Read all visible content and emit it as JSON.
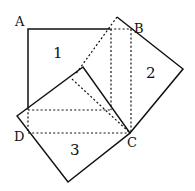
{
  "diagram": {
    "points": {
      "A": {
        "label": "A",
        "x": 28,
        "y": 29
      },
      "B": {
        "label": "B",
        "x": 131,
        "y": 29
      },
      "C": {
        "label": "C",
        "x": 130,
        "y": 133
      },
      "D": {
        "label": "D",
        "x": 28,
        "y": 133
      }
    },
    "regions": [
      {
        "id": "1",
        "label": "1"
      },
      {
        "id": "2",
        "label": "2"
      },
      {
        "id": "3",
        "label": "3"
      }
    ],
    "colors": {
      "stroke": "#111111",
      "background": "#ffffff"
    }
  }
}
